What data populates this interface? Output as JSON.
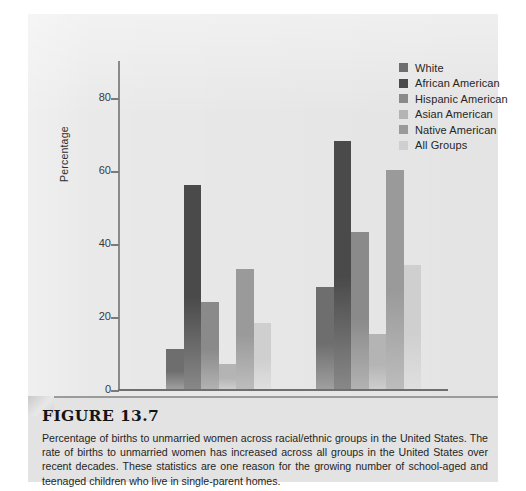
{
  "figure": {
    "heading": "FIGURE 13.7",
    "caption": "Percentage of births to unmarried women across racial/ethnic groups in the United States. The rate of births to unmarried women has increased across all groups in the United States over recent decades. These statistics are one reason for the growing number of school-aged and teenaged children who live in single-parent homes."
  },
  "chart_data": {
    "type": "bar",
    "title": "",
    "xlabel": "",
    "ylabel": "Percentage",
    "ylim": [
      0,
      90
    ],
    "yticks": [
      0,
      20,
      40,
      60,
      80
    ],
    "ytick_labels": [
      "0",
      "20",
      "40",
      "60",
      "80"
    ],
    "grid": false,
    "legend_position": "top-right",
    "categories": [
      "1980",
      "2001"
    ],
    "series": [
      {
        "name": "White",
        "color": "#6e6e6e",
        "values": [
          11,
          28
        ]
      },
      {
        "name": "African American",
        "color": "#4a4a4a",
        "values": [
          56,
          68
        ]
      },
      {
        "name": "Hispanic American",
        "color": "#8a8a8a",
        "values": [
          24,
          43
        ]
      },
      {
        "name": "Asian American",
        "color": "#b4b4b4",
        "values": [
          7,
          15
        ]
      },
      {
        "name": "Native American",
        "color": "#9a9a9a",
        "values": [
          33,
          60
        ]
      },
      {
        "name": "All Groups",
        "color": "#cfcfcf",
        "values": [
          18,
          34
        ]
      }
    ]
  },
  "colors": {
    "panel_background": "#e9e9e9",
    "caption_background": "#e3e3e3",
    "axis": "#7a7a7a",
    "text": "#262626"
  }
}
